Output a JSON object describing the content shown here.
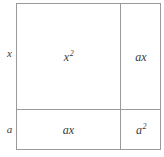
{
  "diagram": {
    "type": "area-model-grid",
    "line_color": "#9a9a9a",
    "text_color": "#3a3a3a",
    "background": "#ffffff",
    "row_labels": [
      {
        "id": "row-x",
        "label": "x"
      },
      {
        "id": "row-a",
        "label": "a"
      }
    ],
    "cells": {
      "top_left": {
        "base": "x",
        "exponent": "2",
        "full": "x2"
      },
      "top_right": {
        "base": "ax",
        "exponent": "",
        "full": "ax"
      },
      "bottom_left": {
        "base": "ax",
        "exponent": "",
        "full": "ax"
      },
      "bottom_right": {
        "base": "a",
        "exponent": "2",
        "full": "a2"
      }
    }
  }
}
